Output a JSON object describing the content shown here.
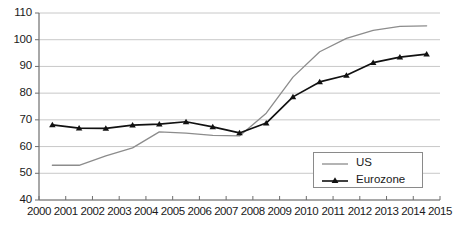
{
  "chart_data": {
    "type": "line",
    "title": "",
    "subtitle": "",
    "xlabel": "",
    "ylabel": "",
    "xlim": [
      2000,
      2015
    ],
    "ylim": [
      40,
      110
    ],
    "yticks": [
      40,
      50,
      60,
      70,
      80,
      90,
      100,
      110
    ],
    "xticks": [
      2000,
      2001,
      2002,
      2003,
      2004,
      2005,
      2006,
      2007,
      2008,
      2009,
      2010,
      2011,
      2012,
      2013,
      2014,
      2015
    ],
    "grid": "horizontal",
    "legend_position": "bottom-right",
    "x": [
      2000.5,
      2001.5,
      2002.5,
      2003.5,
      2004.5,
      2005.5,
      2006.5,
      2007.5,
      2008.5,
      2009.5,
      2010.5,
      2011.5,
      2012.5,
      2013.5,
      2014.5
    ],
    "series": [
      {
        "name": "US",
        "color": "#8c8c8c",
        "marker": "none",
        "values": [
          53.0,
          53.0,
          56.5,
          59.5,
          65.5,
          65.0,
          64.2,
          64.0,
          72.5,
          86.0,
          95.5,
          100.5,
          103.5,
          105.0,
          105.2
        ]
      },
      {
        "name": "Eurozone",
        "color": "#111111",
        "marker": "triangle",
        "values": [
          68.1,
          66.9,
          66.8,
          68.0,
          68.4,
          69.3,
          67.4,
          65.1,
          68.8,
          78.6,
          84.2,
          86.7,
          91.4,
          93.5,
          94.6
        ]
      }
    ]
  },
  "axes": {
    "y_tick_labels": [
      "110",
      "100",
      "90",
      "80",
      "70",
      "60",
      "50",
      "40"
    ],
    "x_tick_labels": [
      "2000",
      "2001",
      "2002",
      "2003",
      "2004",
      "2005",
      "2006",
      "2007",
      "2008",
      "2009",
      "2010",
      "2011",
      "2012",
      "2013",
      "2014",
      "2015"
    ]
  },
  "legend": {
    "items": [
      {
        "label": "US",
        "color": "#8c8c8c",
        "marker": "none"
      },
      {
        "label": "Eurozone",
        "color": "#111111",
        "marker": "triangle"
      }
    ]
  },
  "colors": {
    "us_line": "#8c8c8c",
    "eurozone_line": "#111111",
    "grid": "#c8c8c8",
    "axis": "#6e6e6e",
    "text": "#1a1a1a",
    "background": "#ffffff"
  }
}
